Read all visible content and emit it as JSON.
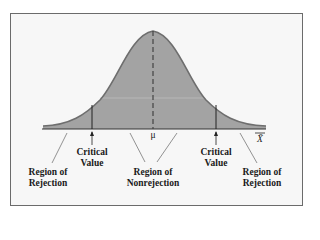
{
  "diagram": {
    "title": "",
    "curve_fill": "#a3a3a3",
    "curve_stroke": "#6e6e6e",
    "axis_label": "X̄",
    "mean_label": "μ",
    "labels": {
      "left_critical": "Critical Value",
      "right_critical": "Critical Value",
      "left_rejection": "Region of Rejection",
      "right_rejection": "Region of Rejection",
      "nonrejection": "Region of Nonrejection"
    },
    "critical_value_1": "Critical",
    "critical_value_2": "Value",
    "region_of": "Region of",
    "rejection": "Rejection",
    "nonrejection_word": "Nonrejection"
  }
}
